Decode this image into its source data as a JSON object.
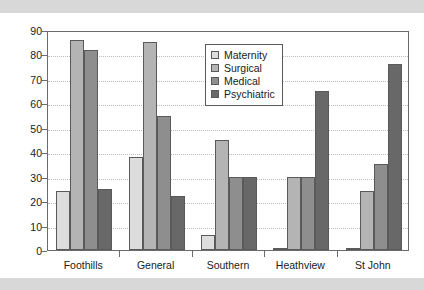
{
  "chart_data": {
    "type": "bar",
    "title": "",
    "xlabel": "",
    "ylabel": "",
    "ylim": [
      0,
      90
    ],
    "ytick_step": 10,
    "yticks": [
      0,
      10,
      20,
      30,
      40,
      50,
      60,
      70,
      80,
      90
    ],
    "grid": true,
    "legend_position": "upper center",
    "categories": [
      "Foothills",
      "General",
      "Southern",
      "Heathview",
      "St John"
    ],
    "series": [
      {
        "name": "Maternity",
        "color": "#dddddd",
        "values": [
          24,
          38,
          6,
          0.5,
          0.5
        ]
      },
      {
        "name": "Surgical",
        "color": "#b4b4b4",
        "values": [
          86,
          85,
          45,
          30,
          24
        ]
      },
      {
        "name": "Medical",
        "color": "#8e8e8e",
        "values": [
          82,
          55,
          30,
          30,
          35
        ]
      },
      {
        "name": "Psychiatric",
        "color": "#686868",
        "values": [
          25,
          22,
          30,
          65,
          76
        ]
      }
    ]
  },
  "figure": {
    "band_color": "#d8d8d8",
    "axis_color": "#6b6b6b",
    "grid_color": "#bdbdbd",
    "background": "#ffffff"
  }
}
